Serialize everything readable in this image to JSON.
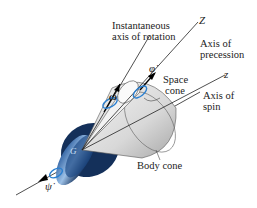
{
  "diagram": {
    "labels": {
      "instantaneous_axis": [
        "Instantaneous",
        "axis of rotation"
      ],
      "axis_Z": "Z",
      "axis_precession": [
        "Axis of",
        "precession"
      ],
      "space_cone": [
        "Space",
        "cone"
      ],
      "axis_z": "z",
      "axis_spin": [
        "Axis of",
        "spin"
      ],
      "body_cone": "Body cone",
      "omega": "ω",
      "phi_dot": "φ̇",
      "psi_dot": "ψ̇",
      "G": "G"
    },
    "colors": {
      "disk_dark": "#14305a",
      "disk_light": "#5a8cc8",
      "arrow_blue": "#2a7fd0",
      "cone_fill": "#e6e6e6",
      "line": "#222222"
    }
  }
}
